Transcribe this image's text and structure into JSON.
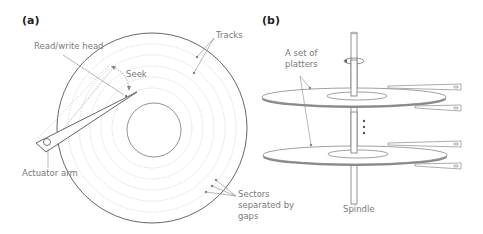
{
  "panels": {
    "a": {
      "label": "(a)",
      "annotations": {
        "read_write_head": "Read/write head",
        "seek": "Seek",
        "tracks": "Tracks",
        "actuator_arm": "Actuator arm",
        "sectors_line1": "Sectors",
        "sectors_line2": "separated by",
        "sectors_line3": "gaps"
      }
    },
    "b": {
      "label": "(b)",
      "annotations": {
        "platters_line1": "A set of",
        "platters_line2": "platters",
        "spindle": "Spindle"
      }
    }
  },
  "colors": {
    "line": "#555555",
    "light_line": "#bdbdbd",
    "text": "#7a7a7a",
    "platter_edge": "#8a8a8a"
  }
}
